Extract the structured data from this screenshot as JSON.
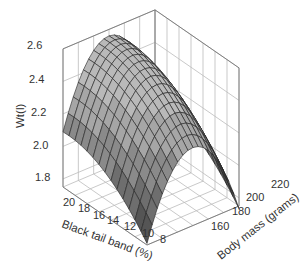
{
  "chart_data": {
    "type": "surface3d",
    "title": "",
    "zlabel": "Wt(l)",
    "xlabel": "Black tail band (%)",
    "ylabel": "Body mass  (grams)",
    "z_ticks": [
      "1.8",
      "2.0",
      "2.2",
      "2.4",
      "2.6"
    ],
    "x_ticks": [
      "20",
      "18",
      "16",
      "14",
      "12",
      "10",
      "8"
    ],
    "y_ticks": [
      "160",
      "180",
      "200",
      "220"
    ],
    "zlim": [
      1.75,
      2.6
    ],
    "xlim": [
      7,
      21
    ],
    "ylim": [
      150,
      225
    ],
    "grid": true,
    "surface_color": "#a8a8a8",
    "mesh_color": "#222222",
    "grid_color": "#bbbbbb",
    "sample_points": [
      {
        "band": 20,
        "mass": 150,
        "wt": 2.28
      },
      {
        "band": 20,
        "mass": 185,
        "wt": 2.55
      },
      {
        "band": 20,
        "mass": 225,
        "wt": 2.3
      },
      {
        "band": 14,
        "mass": 150,
        "wt": 2.05
      },
      {
        "band": 14,
        "mass": 185,
        "wt": 2.45
      },
      {
        "band": 14,
        "mass": 225,
        "wt": 2.15
      },
      {
        "band": 8,
        "mass": 150,
        "wt": 1.75
      },
      {
        "band": 8,
        "mass": 185,
        "wt": 2.2
      },
      {
        "band": 8,
        "mass": 225,
        "wt": 1.85
      }
    ]
  }
}
